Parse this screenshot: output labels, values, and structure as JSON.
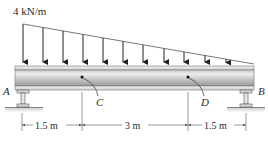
{
  "diagram": {
    "type": "simply-supported beam with linearly varying distributed load",
    "load": {
      "label": "4 kN/m",
      "max_intensity": 4,
      "unit": "kN/m",
      "distribution": "triangular, maximum at A decreasing to zero at B"
    },
    "points": {
      "A": "A",
      "B": "B",
      "C": "C",
      "D": "D"
    },
    "dimensions": [
      {
        "label": "1.5 m",
        "from": "A",
        "to": "C"
      },
      {
        "label": "3 m",
        "from": "C",
        "to": "D"
      },
      {
        "label": "1.5 m",
        "from": "D",
        "to": "B"
      }
    ],
    "supports": {
      "A": "pin/fixed base I-support",
      "B": "I-support"
    },
    "colors": {
      "load_lines": "#333333",
      "beam_light": "#e6e6e6",
      "beam_dark": "#9a9a9a",
      "text": "#2a2a2a"
    }
  }
}
